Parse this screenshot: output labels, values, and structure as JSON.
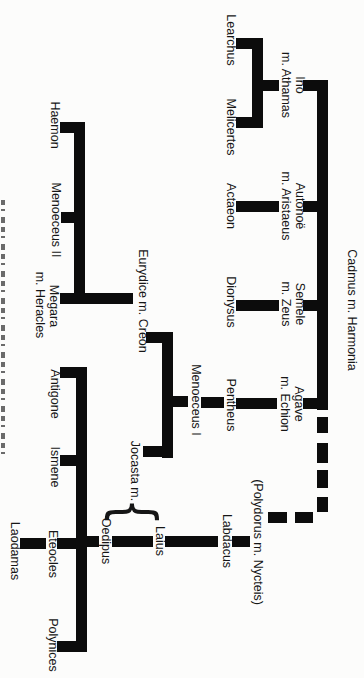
{
  "figure": {
    "type": "genealogy-family-tree",
    "orientation": "tree rotated 90 degrees clockwise on the page",
    "colors": {
      "background": "#fcfcfb",
      "ink": "#161616",
      "line": "#0c0c0c"
    },
    "caption_fragment": "cropped caption strip at page edge (illegible)"
  },
  "labels": {
    "cadmus": "Cadmus m. Harmonia",
    "ino": "Ino",
    "ino_spouse": "m. Athamas",
    "autonoe": "Autonoë",
    "autonoe_spouse": "m. Aristaeus",
    "semele": "Semele",
    "semele_spouse": "m. Zeus",
    "agave": "Agave",
    "agave_spouse": "m. Echion",
    "polydorus": "(Polydorus m. Nycteis)",
    "learchus": "Learchus",
    "melicertes": "Melicertes",
    "actaeon": "Actaeon",
    "dionysus": "Dionysus",
    "pentheus": "Pentheus",
    "labdacus": "Labdacus",
    "menoeceus1": "Menoeceus I",
    "eurydice": "Eurydice m. Creon",
    "jocasta": "Jocasta m.",
    "brace": "{",
    "laius": "Laius",
    "oedipus": "Oedipus",
    "haemon": "Haemon",
    "menoeceus2": "Menoeceus II",
    "megara": "Megara",
    "megara_spouse": "m. Heracles",
    "antigone": "Antigone",
    "ismene": "Ismene",
    "eteocles": "Eteocles",
    "polynices": "Polynices",
    "laodamas": "Laodamas"
  },
  "relationships": [
    {
      "parents": "Cadmus m. Harmonia",
      "children": [
        "Ino m. Athamas",
        "Autonoë m. Aristaeus",
        "Semele m. Zeus",
        "Agave m. Echion",
        "(Polydorus m. Nycteis)"
      ],
      "style_note": "link to (Polydorus m. Nycteis) drawn dashed"
    },
    {
      "parents": "Ino m. Athamas",
      "children": [
        "Learchus",
        "Melicertes"
      ]
    },
    {
      "parents": "Autonoë m. Aristaeus",
      "children": [
        "Actaeon"
      ]
    },
    {
      "parents": "Semele m. Zeus",
      "children": [
        "Dionysus"
      ]
    },
    {
      "parents": "Agave m. Echion",
      "children": [
        "Pentheus"
      ]
    },
    {
      "parents": "Pentheus",
      "children": [
        "Menoeceus I"
      ]
    },
    {
      "parents": "(Polydorus m. Nycteis)",
      "children": [
        "Labdacus"
      ]
    },
    {
      "parents": "Labdacus",
      "children": [
        "Laius"
      ]
    },
    {
      "parents": "Menoeceus I",
      "children": [
        "Creon (of Eurydice m. Creon)",
        "Jocasta"
      ]
    },
    {
      "parents": "Laius (Jocasta m. brace)",
      "children": [
        "Oedipus"
      ]
    },
    {
      "parents": "Oedipus",
      "children": [
        "Antigone",
        "Ismene",
        "Eteocles",
        "Polynices"
      ]
    },
    {
      "parents": "Eurydice m. Creon",
      "children": [
        "Haemon",
        "Menoeceus II",
        "Megara m. Heracles"
      ]
    },
    {
      "parents": "Eteocles",
      "children": [
        "Laodamas"
      ]
    },
    {
      "note": "curly brace groups Laius and Oedipus as husbands of Jocasta"
    }
  ]
}
